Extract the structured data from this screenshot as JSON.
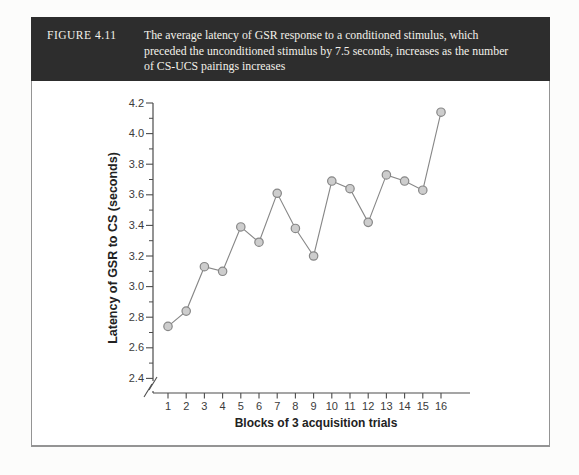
{
  "figure": {
    "label": "FIGURE 4.11",
    "caption_lines": [
      "The average latency of GSR response to a conditioned stimulus, which",
      "preceded the unconditioned stimulus by 7.5 seconds, increases as the number",
      "of CS-UCS pairings increases"
    ]
  },
  "chart_data": {
    "type": "line",
    "x": [
      1,
      2,
      3,
      4,
      5,
      6,
      7,
      8,
      9,
      10,
      11,
      12,
      13,
      14,
      15,
      16
    ],
    "values": [
      2.74,
      2.84,
      3.13,
      3.1,
      3.39,
      3.29,
      3.61,
      3.38,
      3.2,
      3.69,
      3.64,
      3.42,
      3.73,
      3.69,
      3.63,
      4.14
    ],
    "series_name": "Average latency of GSR response",
    "xlabel": "Blocks of 3 acquisition trials",
    "ylabel": "Latency of GSR to CS (seconds)",
    "ylim": [
      2.4,
      4.2
    ],
    "ytick_major_step": 0.2,
    "ytick_minor_step": 0.1,
    "yticks": [
      2.4,
      2.6,
      2.8,
      3.0,
      3.2,
      3.4,
      3.6,
      3.8,
      4.0,
      4.2
    ],
    "xticks": [
      1,
      2,
      3,
      4,
      5,
      6,
      7,
      8,
      9,
      10,
      11,
      12,
      13,
      14,
      15,
      16
    ],
    "axis_break_bottom": true,
    "grid": false,
    "legend": "none",
    "marker": "circle"
  },
  "colors": {
    "header_bg": "#2d2d2d",
    "header_text": "#f3f1ea",
    "panel_bg": "#ffffff",
    "panel_border": "#949494",
    "axis": "#4c4c4c",
    "tick_label": "#3b3b3b",
    "axis_label": "#222222",
    "line": "#878787",
    "marker_fill": "#cdcdcd",
    "marker_stroke": "#878787"
  }
}
